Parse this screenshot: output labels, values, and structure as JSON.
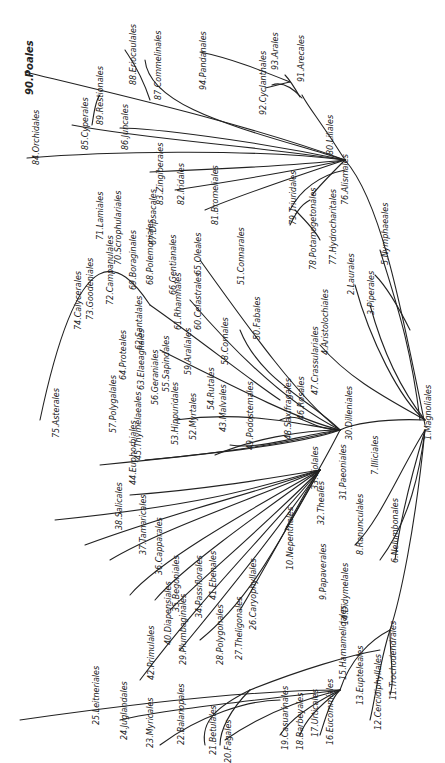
{
  "diagram": {
    "type": "phylogenetic-tree",
    "root": "1.Magnoliales",
    "orientation": "rotated-90",
    "line_color": "#222222",
    "background": "#ffffff"
  },
  "labels": [
    {
      "id": "1",
      "text": "1.Magnoliales",
      "x": 425,
      "y": 440
    },
    {
      "id": "2",
      "text": "2.Laurales",
      "x": 348,
      "y": 295
    },
    {
      "id": "3",
      "text": "3.Piperales",
      "x": 368,
      "y": 315
    },
    {
      "id": "4",
      "text": "4.Aristolochiales",
      "x": 322,
      "y": 355
    },
    {
      "id": "5",
      "text": "5.Nymphaeales",
      "x": 382,
      "y": 265
    },
    {
      "id": "6",
      "text": "6.Nelumbonales",
      "x": 392,
      "y": 563
    },
    {
      "id": "7",
      "text": "7.Illiciales",
      "x": 372,
      "y": 475
    },
    {
      "id": "8",
      "text": "8.Ranunculales",
      "x": 357,
      "y": 555
    },
    {
      "id": "9",
      "text": "9.Papaverales",
      "x": 320,
      "y": 600
    },
    {
      "id": "10",
      "text": "10.Nepenthales",
      "x": 287,
      "y": 570
    },
    {
      "id": "11",
      "text": "11.Trochodendrales",
      "x": 390,
      "y": 700
    },
    {
      "id": "12",
      "text": "12.Cercidiphyllales",
      "x": 375,
      "y": 730
    },
    {
      "id": "13",
      "text": "13.Eupteleales",
      "x": 357,
      "y": 705
    },
    {
      "id": "14",
      "text": "14.Didymelales",
      "x": 342,
      "y": 625
    },
    {
      "id": "15",
      "text": "15.Hamamelidales",
      "x": 340,
      "y": 680
    },
    {
      "id": "16",
      "text": "16.Eucommiales",
      "x": 327,
      "y": 745
    },
    {
      "id": "17",
      "text": "17.Urticales",
      "x": 312,
      "y": 737
    },
    {
      "id": "18",
      "text": "18.Barbeyales",
      "x": 297,
      "y": 750
    },
    {
      "id": "19",
      "text": "19.Casuarinales",
      "x": 282,
      "y": 750
    },
    {
      "id": "20",
      "text": "20.Fagales",
      "x": 225,
      "y": 763
    },
    {
      "id": "21",
      "text": "21.Betulales",
      "x": 210,
      "y": 755
    },
    {
      "id": "22",
      "text": "22.Balanopales",
      "x": 178,
      "y": 745
    },
    {
      "id": "23",
      "text": "23.Myricales",
      "x": 147,
      "y": 748
    },
    {
      "id": "24",
      "text": "24.Juglandales",
      "x": 121,
      "y": 740
    },
    {
      "id": "25",
      "text": "25.Leitneriales",
      "x": 93,
      "y": 725
    },
    {
      "id": "26",
      "text": "26.Caryophyllales",
      "x": 250,
      "y": 630
    },
    {
      "id": "27",
      "text": "27.Theligonales",
      "x": 236,
      "y": 660
    },
    {
      "id": "28",
      "text": "28.Polygonales",
      "x": 217,
      "y": 665
    },
    {
      "id": "29",
      "text": "29.Plumbaginales",
      "x": 180,
      "y": 665
    },
    {
      "id": "30",
      "text": "30.Dilleniales",
      "x": 346,
      "y": 440
    },
    {
      "id": "31",
      "text": "31.Paeoniales",
      "x": 340,
      "y": 500
    },
    {
      "id": "32",
      "text": "32.Theales",
      "x": 318,
      "y": 525
    },
    {
      "id": "33",
      "text": "33.Violales",
      "x": 312,
      "y": 490
    },
    {
      "id": "34",
      "text": "34.Passiflorales",
      "x": 196,
      "y": 618
    },
    {
      "id": "35",
      "text": "35.Begoniales",
      "x": 173,
      "y": 612
    },
    {
      "id": "36",
      "text": "36.Capparales",
      "x": 156,
      "y": 575
    },
    {
      "id": "37",
      "text": "37.Tamaricales",
      "x": 140,
      "y": 555
    },
    {
      "id": "38",
      "text": "38.Salicales",
      "x": 116,
      "y": 530
    },
    {
      "id": "40",
      "text": "40.Diapensiales",
      "x": 165,
      "y": 645
    },
    {
      "id": "41",
      "text": "41.Ebenales",
      "x": 210,
      "y": 600
    },
    {
      "id": "42",
      "text": "42.Primulales",
      "x": 148,
      "y": 680
    },
    {
      "id": "43",
      "text": "43.Malvales",
      "x": 220,
      "y": 432
    },
    {
      "id": "44",
      "text": "44.Euphorbiales",
      "x": 130,
      "y": 485
    },
    {
      "id": "45",
      "text": "45.Thymelaeales",
      "x": 135,
      "y": 460
    },
    {
      "id": "46",
      "text": "46.Rosales",
      "x": 298,
      "y": 420
    },
    {
      "id": "47",
      "text": "47.Crassulariales",
      "x": 312,
      "y": 395
    },
    {
      "id": "48",
      "text": "48.Saxifragales",
      "x": 285,
      "y": 440
    },
    {
      "id": "49",
      "text": "49.Podostemales",
      "x": 247,
      "y": 450
    },
    {
      "id": "50",
      "text": "50.Fabales",
      "x": 254,
      "y": 340
    },
    {
      "id": "51",
      "text": "51.Connarales",
      "x": 238,
      "y": 285
    },
    {
      "id": "52",
      "text": "52.Myrtales",
      "x": 190,
      "y": 440
    },
    {
      "id": "53",
      "text": "53.Hippuridales",
      "x": 172,
      "y": 445
    },
    {
      "id": "54",
      "text": "54.Rutales",
      "x": 208,
      "y": 410
    },
    {
      "id": "55",
      "text": "55.Sapindales",
      "x": 163,
      "y": 392
    },
    {
      "id": "56",
      "text": "56.Geraniales",
      "x": 152,
      "y": 405
    },
    {
      "id": "57",
      "text": "57.Polygalales",
      "x": 110,
      "y": 433
    },
    {
      "id": "58",
      "text": "58.Cornales",
      "x": 222,
      "y": 365
    },
    {
      "id": "59",
      "text": "59.Araliales",
      "x": 185,
      "y": 375
    },
    {
      "id": "60",
      "text": "60.Celastrales",
      "x": 195,
      "y": 330
    },
    {
      "id": "61",
      "text": "61.Rhamnales",
      "x": 175,
      "y": 330
    },
    {
      "id": "62",
      "text": "62.Santalales",
      "x": 136,
      "y": 350
    },
    {
      "id": "63",
      "text": "63.Elaeagnales",
      "x": 138,
      "y": 390
    },
    {
      "id": "64",
      "text": "64.Proteales",
      "x": 120,
      "y": 380
    },
    {
      "id": "65",
      "text": "65.Oleales",
      "x": 195,
      "y": 275
    },
    {
      "id": "66",
      "text": "66.Gentianales",
      "x": 170,
      "y": 295
    },
    {
      "id": "67",
      "text": "67.Dipsacales",
      "x": 150,
      "y": 245
    },
    {
      "id": "68",
      "text": "68.Polemoniales",
      "x": 147,
      "y": 285
    },
    {
      "id": "69",
      "text": "69.Boraginales",
      "x": 130,
      "y": 290
    },
    {
      "id": "70",
      "text": "70.Scrophulariales",
      "x": 115,
      "y": 265
    },
    {
      "id": "71",
      "text": "71.Lamiales",
      "x": 97,
      "y": 240
    },
    {
      "id": "72",
      "text": "72.Campanulales",
      "x": 107,
      "y": 305
    },
    {
      "id": "73",
      "text": "73.Goodeniales",
      "x": 87,
      "y": 320
    },
    {
      "id": "74",
      "text": "74.Calycerales",
      "x": 75,
      "y": 330
    },
    {
      "id": "75",
      "text": "75.Asterales",
      "x": 53,
      "y": 438
    },
    {
      "id": "76",
      "text": "76.Alismales",
      "x": 342,
      "y": 205
    },
    {
      "id": "77",
      "text": "77.Hydrocharitales",
      "x": 330,
      "y": 265
    },
    {
      "id": "78",
      "text": "78.Potamogetonales",
      "x": 310,
      "y": 270
    },
    {
      "id": "79",
      "text": "79.Triuridales",
      "x": 290,
      "y": 225
    },
    {
      "id": "80",
      "text": "80.Liliales",
      "x": 327,
      "y": 155
    },
    {
      "id": "81",
      "text": "81.Bromeliales",
      "x": 212,
      "y": 225
    },
    {
      "id": "82",
      "text": "82.Iridales",
      "x": 178,
      "y": 205
    },
    {
      "id": "83",
      "text": "83.Zingiberales",
      "x": 157,
      "y": 205
    },
    {
      "id": "84",
      "text": "84.Orchidales",
      "x": 33,
      "y": 165
    },
    {
      "id": "85",
      "text": "85.Cyperales",
      "x": 82,
      "y": 150
    },
    {
      "id": "86",
      "text": "86.Juncales",
      "x": 122,
      "y": 150
    },
    {
      "id": "87",
      "text": "87.Commelinales",
      "x": 155,
      "y": 100
    },
    {
      "id": "88",
      "text": "88.Eriocaulales",
      "x": 130,
      "y": 85
    },
    {
      "id": "89",
      "text": "89.Restionales",
      "x": 97,
      "y": 125
    },
    {
      "id": "90",
      "text": "90.Poales",
      "x": 25,
      "y": 95,
      "style": "big"
    },
    {
      "id": "91",
      "text": "91.Arecales",
      "x": 298,
      "y": 82
    },
    {
      "id": "92",
      "text": "92.Cyclanthales",
      "x": 260,
      "y": 115
    },
    {
      "id": "93",
      "text": "93.Arales",
      "x": 272,
      "y": 70
    },
    {
      "id": "94",
      "text": "94.Pandanales",
      "x": 200,
      "y": 90
    }
  ]
}
